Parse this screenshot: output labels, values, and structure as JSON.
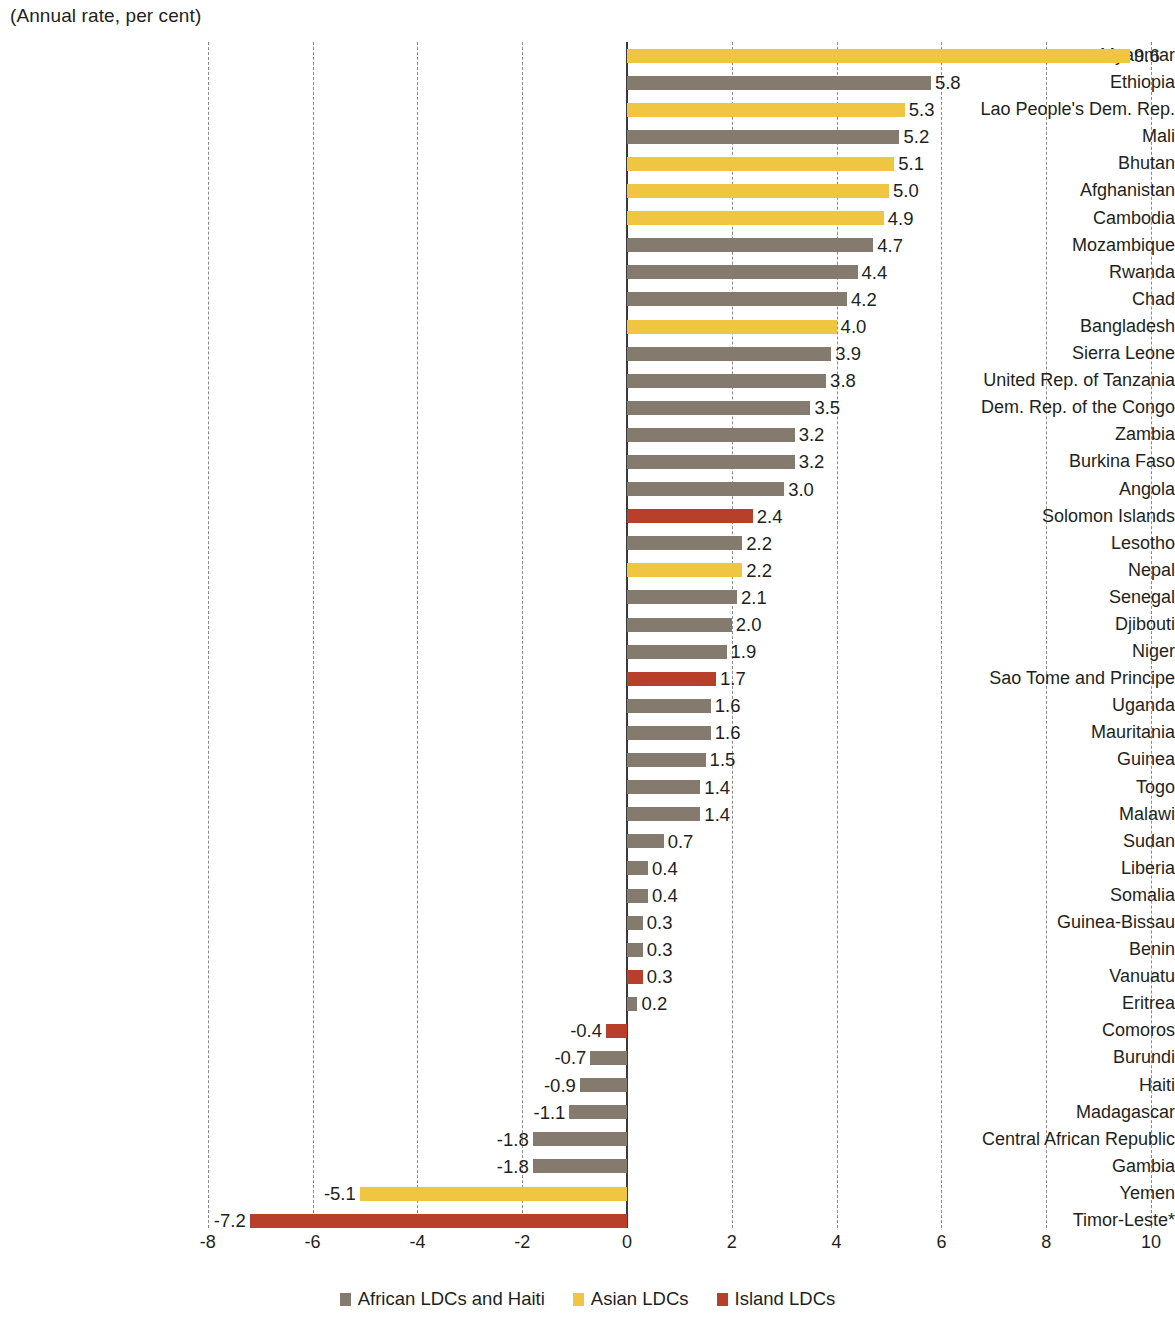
{
  "subtitle": "(Annual rate, per cent)",
  "chart_data": {
    "type": "bar",
    "orientation": "horizontal",
    "title": "",
    "subtitle": "(Annual rate, per cent)",
    "xlabel": "",
    "ylabel": "",
    "xlim": [
      -8,
      10
    ],
    "xticks": [
      -8,
      -6,
      -4,
      -2,
      0,
      2,
      4,
      6,
      8,
      10
    ],
    "xtick_labels": [
      "-8",
      "-6",
      "-4",
      "-2",
      "0",
      "2",
      "4",
      "6",
      "8",
      "10"
    ],
    "grid": true,
    "grid_axis": "x",
    "legend_position": "bottom",
    "colors": {
      "african": "#847a6e",
      "asian": "#f0c541",
      "island": "#b8402a"
    },
    "legend": [
      {
        "label": "African LDCs and Haiti",
        "color": "#847a6e",
        "group": "african"
      },
      {
        "label": "Asian LDCs",
        "color": "#f0c541",
        "group": "asian"
      },
      {
        "label": "Island LDCs",
        "color": "#b8402a",
        "group": "island"
      }
    ],
    "categories": [
      "Myanmar",
      "Ethiopia",
      "Lao People's Dem. Rep.",
      "Mali",
      "Bhutan",
      "Afghanistan",
      "Cambodia",
      "Mozambique",
      "Rwanda",
      "Chad",
      "Bangladesh",
      "Sierra Leone",
      "United Rep. of Tanzania",
      "Dem. Rep. of the Congo",
      "Zambia",
      "Burkina Faso",
      "Angola",
      "Solomon Islands",
      "Lesotho",
      "Nepal",
      "Senegal",
      "Djibouti",
      "Niger",
      "Sao Tome and Principe",
      "Uganda",
      "Mauritania",
      "Guinea",
      "Togo",
      "Malawi",
      "Sudan",
      "Liberia",
      "Somalia",
      "Guinea-Bissau",
      "Benin",
      "Vanuatu",
      "Eritrea",
      "Comoros",
      "Burundi",
      "Haiti",
      "Madagascar",
      "Central African Republic",
      "Gambia",
      "Yemen",
      "Timor-Leste*"
    ],
    "values": [
      9.6,
      5.8,
      5.3,
      5.2,
      5.1,
      5.0,
      4.9,
      4.7,
      4.4,
      4.2,
      4.0,
      3.9,
      3.8,
      3.5,
      3.2,
      3.2,
      3.0,
      2.4,
      2.2,
      2.2,
      2.1,
      2.0,
      1.9,
      1.7,
      1.6,
      1.6,
      1.5,
      1.4,
      1.4,
      0.7,
      0.4,
      0.4,
      0.3,
      0.3,
      0.3,
      0.2,
      -0.4,
      -0.7,
      -0.9,
      -1.1,
      -1.8,
      -1.8,
      -5.1,
      -7.2
    ],
    "value_labels": [
      "9.6",
      "5.8",
      "5.3",
      "5.2",
      "5.1",
      "5.0",
      "4.9",
      "4.7",
      "4.4",
      "4.2",
      "4.0",
      "3.9",
      "3.8",
      "3.5",
      "3.2",
      "3.2",
      "3.0",
      "2.4",
      "2.2",
      "2.2",
      "2.1",
      "2.0",
      "1.9",
      "1.7",
      "1.6",
      "1.6",
      "1.5",
      "1.4",
      "1.4",
      "0.7",
      "0.4",
      "0.4",
      "0.3",
      "0.3",
      "0.3",
      "0.2",
      "-0.4",
      "-0.7",
      "-0.9",
      "-1.1",
      "-1.8",
      "-1.8",
      "-5.1",
      "-7.2"
    ],
    "groups": [
      "asian",
      "african",
      "asian",
      "african",
      "asian",
      "asian",
      "asian",
      "african",
      "african",
      "african",
      "asian",
      "african",
      "african",
      "african",
      "african",
      "african",
      "african",
      "island",
      "african",
      "asian",
      "african",
      "african",
      "african",
      "island",
      "african",
      "african",
      "african",
      "african",
      "african",
      "african",
      "african",
      "african",
      "african",
      "african",
      "island",
      "african",
      "island",
      "african",
      "african",
      "african",
      "african",
      "african",
      "asian",
      "island"
    ]
  }
}
